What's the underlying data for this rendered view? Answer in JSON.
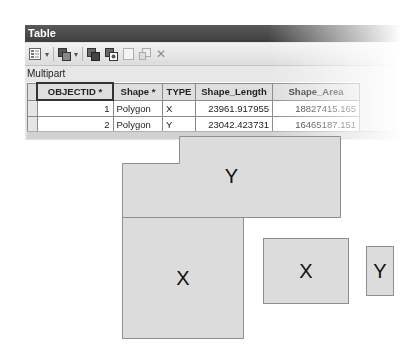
{
  "window": {
    "title": "Table",
    "layer_name": "Multipart"
  },
  "toolbar": {
    "icons": [
      {
        "name": "table-options-icon",
        "has_dropdown": true
      },
      {
        "name": "related-tables-icon",
        "has_dropdown": true
      },
      {
        "name": "select-by-attributes-icon",
        "has_dropdown": false
      },
      {
        "name": "switch-selection-icon",
        "has_dropdown": false
      },
      {
        "name": "clear-selection-icon",
        "has_dropdown": false
      },
      {
        "name": "zoom-to-selected-icon",
        "has_dropdown": false
      },
      {
        "name": "delete-selected-icon",
        "has_dropdown": false
      }
    ],
    "dropdown_glyph": "▾",
    "delete_glyph": "✕"
  },
  "table": {
    "columns": [
      "OBJECTID *",
      "Shape *",
      "TYPE",
      "Shape_Length",
      "Shape_Area"
    ],
    "rows": [
      {
        "objectid": "1",
        "shape": "Polygon",
        "type": "X",
        "shape_length": "23961.917955",
        "shape_area": "18827415.165"
      },
      {
        "objectid": "2",
        "shape": "Polygon",
        "type": "Y",
        "shape_length": "23042.423731",
        "shape_area": "16465187.151"
      }
    ]
  },
  "map": {
    "polygons": [
      {
        "id": "y-large",
        "label": "Y"
      },
      {
        "id": "x-large",
        "label": "X"
      },
      {
        "id": "x-medium",
        "label": "X"
      },
      {
        "id": "y-small",
        "label": "Y"
      }
    ],
    "fill_color": "#dcdcdc",
    "outline_color": "#8f8f8f"
  }
}
